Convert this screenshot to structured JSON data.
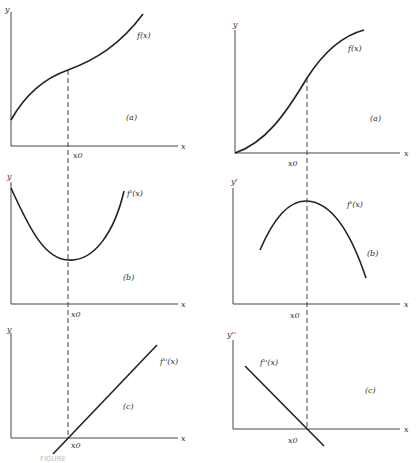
{
  "figure": {
    "left_column": {
      "panel_a": {
        "curve_label": "f(x)",
        "panel_label": "(a)",
        "y_label": "y",
        "x_label": "x",
        "x0_label": "x0"
      },
      "panel_b": {
        "curve_label": "f'(x)",
        "panel_label": "(b)",
        "y_label": "y",
        "x_label": "x",
        "x0_label": "x0"
      },
      "panel_c": {
        "curve_label": "f''(x)",
        "panel_label": "(c)",
        "y_label": "y",
        "x_label": "x",
        "x0_label": "x0"
      }
    },
    "right_column": {
      "panel_a": {
        "curve_label": "f(x)",
        "panel_label": "(a)",
        "y_label": "y",
        "x_label": "x",
        "x0_label": "x0"
      },
      "panel_b": {
        "curve_label": "f'(x)",
        "panel_label": "(b)",
        "y_label": "y'",
        "x_label": "x",
        "x0_label": "x0"
      },
      "panel_c": {
        "curve_label": "f''(x)",
        "panel_label": "(c)",
        "y_label": "y''",
        "x_label": "x",
        "x0_label": "x0"
      }
    },
    "caption": "FIGURE"
  }
}
